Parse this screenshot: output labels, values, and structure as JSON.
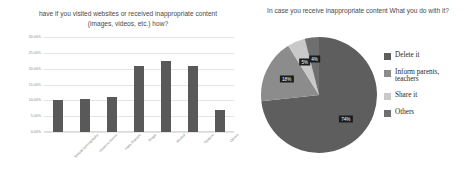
{
  "chart_data": [
    {
      "type": "bar",
      "title": "have if you visited websites or received inappropriate content (images, videos, etc.) how?",
      "xlabel": "",
      "ylabel": "",
      "categories": [
        "Sexual /pornography",
        "Violence /horror",
        "Hate /Racism",
        "Drugs",
        "Alcohol",
        "Tobacco",
        "Others"
      ],
      "values": [
        10.0,
        10.5,
        11.0,
        21.0,
        22.5,
        21.0,
        7.0
      ],
      "ylim": [
        0,
        30
      ],
      "yticks": [
        "0.00%",
        "5.00%",
        "10.00%",
        "15.00%",
        "20.00%",
        "25.00%",
        "30.00%"
      ],
      "grid": true,
      "legend": "none",
      "bar_color": "#595959"
    },
    {
      "type": "pie",
      "title": "In case you receive inappropriate content What you do with it?",
      "labels": [
        "Delete it",
        "Inform parents, teachers",
        "Share it",
        "Others"
      ],
      "values": [
        74,
        18,
        5,
        4
      ],
      "value_labels": [
        "74%",
        "18%",
        "5%",
        "4%"
      ],
      "colors": [
        "#5e5e5e",
        "#8c8c8c",
        "#c9c9c9",
        "#6f6f6f"
      ],
      "legend": "right"
    }
  ],
  "bar_chart": {
    "title": "have if you visited websites or received inappropriate content (images, videos, etc.) how?",
    "yticks": [
      {
        "label": "30.00%"
      },
      {
        "label": "25.00%"
      },
      {
        "label": "20.00%"
      },
      {
        "label": "15.00%"
      },
      {
        "label": "10.00%"
      },
      {
        "label": "5.00%"
      },
      {
        "label": "0.00%"
      }
    ],
    "categories": [
      {
        "label": "Sexual /pornography"
      },
      {
        "label": "Violence /horror"
      },
      {
        "label": "Hate /Racism"
      },
      {
        "label": "Drugs"
      },
      {
        "label": "Alcohol"
      },
      {
        "label": "Tobacco"
      },
      {
        "label": "Others"
      }
    ]
  },
  "pie_chart": {
    "title": "In case you receive inappropriate content What you do with it?",
    "slices": [
      {
        "label": "Delete it",
        "value_label": "74%"
      },
      {
        "label": "Inform parents, teachers",
        "value_label": "18%"
      },
      {
        "label": "Share it",
        "value_label": "5%"
      },
      {
        "label": "Others",
        "value_label": "4%"
      }
    ]
  }
}
